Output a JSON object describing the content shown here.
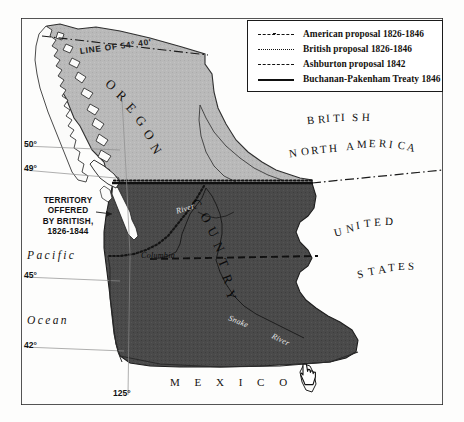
{
  "map": {
    "frame": {
      "x": 21,
      "y": 18,
      "w": 422,
      "h": 387
    },
    "legend": {
      "title": "",
      "items": [
        {
          "symbol": "dash-dot-line",
          "label": "American proposal 1826-1846"
        },
        {
          "symbol": "dotted-line",
          "label": "British proposal 1826-1846"
        },
        {
          "symbol": "dashed-line",
          "label": "Ashburton proposal 1842"
        },
        {
          "symbol": "solid-line",
          "label": "Buchanan-Pakenham Treaty 1846"
        }
      ]
    },
    "regions": [
      {
        "name": "oregon-country",
        "label": "OREGON COUNTRY",
        "fill": "#b9b9b9"
      },
      {
        "name": "british-north-america",
        "label": "BRITISH NORTH AMERICA",
        "fill": "#ffffff"
      },
      {
        "name": "united-states",
        "label": "UNITED STATES",
        "fill": "#ffffff"
      },
      {
        "name": "mexico",
        "label": "MEXICO",
        "fill": "#ffffff"
      },
      {
        "name": "disputed-south",
        "label": "",
        "fill": "#4a4a4a"
      }
    ],
    "labels": {
      "oregon": "OREGON",
      "country": "COUNTRY",
      "british": "BRITISH",
      "north_america": "NORTH AMERICA",
      "united": "UNITED",
      "states": "STATES",
      "mexico": "M E X I C O",
      "pacific": "Pacific",
      "ocean": "Ocean",
      "line_5440": "LINE OF 54° 40'",
      "callout": "TERRITORY\nOFFERED\nBY BRITISH,\n1826-1844",
      "callout_lines": [
        "TERRITORY",
        "OFFERED",
        "BY BRITISH,",
        "1826-1844"
      ]
    },
    "rivers": [
      {
        "name": "columbia-river",
        "label": "Columbia"
      },
      {
        "name": "snake-river",
        "label": "Snake"
      },
      {
        "name": "snake-river-word",
        "label": "River"
      },
      {
        "name": "upper-river",
        "label": "River"
      }
    ],
    "graticule": {
      "latitudes": [
        {
          "value": "50°",
          "y": 146
        },
        {
          "value": "49°",
          "y": 170
        },
        {
          "value": "45°",
          "y": 277
        },
        {
          "value": "42°",
          "y": 347
        }
      ],
      "longitudes": [
        {
          "value": "125°",
          "x": 128
        }
      ]
    },
    "colors": {
      "land_light": "#b9b9b9",
      "land_dark": "#4a4a4a",
      "water": "#fdfdfc",
      "ink": "#141414",
      "frame": "#2a2a2a"
    },
    "cursor": {
      "name": "hand-pointer-cursor",
      "x": 300,
      "y": 362
    }
  }
}
